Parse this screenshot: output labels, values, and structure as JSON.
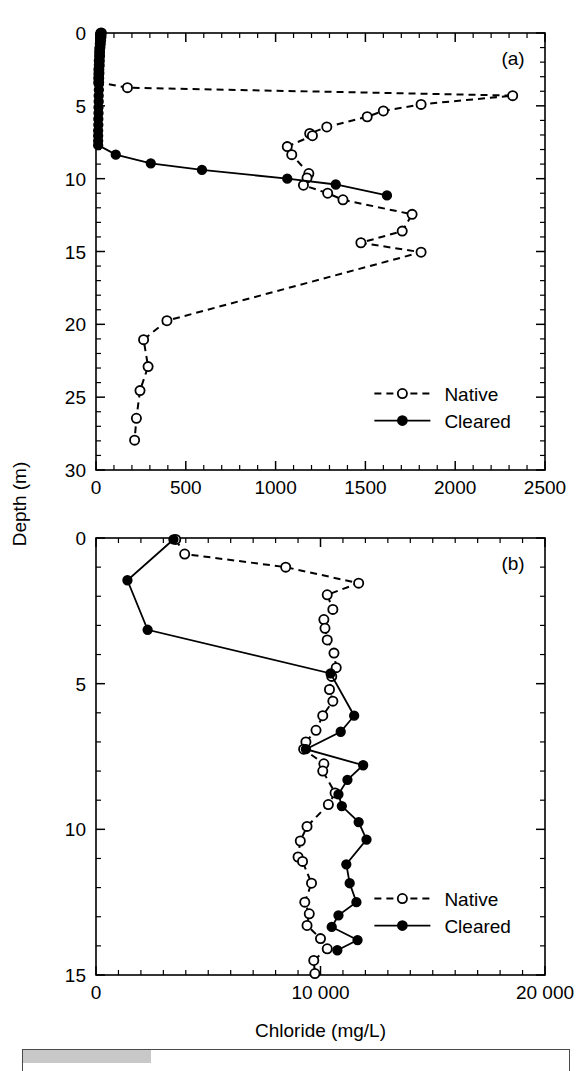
{
  "figure": {
    "y_axis_title": "Depth (m)",
    "x_axis_title": "Chloride (mg/L)"
  },
  "panel_a": {
    "label": "(a)",
    "legend": [
      {
        "label": "Native",
        "marker": "open-circle",
        "line": "dashed"
      },
      {
        "label": "Cleared",
        "marker": "filled-circle",
        "line": "solid"
      }
    ],
    "x_ticklabels": [
      "0",
      "500",
      "1000",
      "1500",
      "2000",
      "2500"
    ],
    "y_ticklabels": [
      "0",
      "5",
      "10",
      "15",
      "20",
      "25",
      "30"
    ]
  },
  "panel_b": {
    "label": "(b)",
    "legend": [
      {
        "label": "Native",
        "marker": "open-circle",
        "line": "dashed"
      },
      {
        "label": "Cleared",
        "marker": "filled-circle",
        "line": "solid"
      }
    ],
    "x_ticklabels": [
      "0",
      "10 000",
      "20 000"
    ],
    "y_ticklabels": [
      "0",
      "5",
      "10",
      "15"
    ]
  },
  "chart_data": [
    {
      "id": "panel-a",
      "type": "line",
      "title": "(a)",
      "xlabel": "Chloride (mg/L)",
      "ylabel": "Depth (m)",
      "xlim": [
        0,
        2500
      ],
      "ylim": [
        0,
        30
      ],
      "y_inverted": true,
      "x_major_tick": 500,
      "x_minor_tick": 100,
      "y_major_tick": 5,
      "y_minor_tick": 1,
      "grid": false,
      "legend_position": "lower-right",
      "x_unit": "mg/L",
      "y_unit": "m",
      "series": [
        {
          "name": "Native",
          "marker": "open-circle",
          "linestyle": "dashed",
          "points": [
            {
              "x": 30,
              "y": 0.0
            },
            {
              "x": 28,
              "y": 0.25
            },
            {
              "x": 26,
              "y": 0.5
            },
            {
              "x": 24,
              "y": 0.75
            },
            {
              "x": 22,
              "y": 1.0
            },
            {
              "x": 20,
              "y": 1.3
            },
            {
              "x": 20,
              "y": 1.6
            },
            {
              "x": 18,
              "y": 1.9
            },
            {
              "x": 18,
              "y": 2.2
            },
            {
              "x": 16,
              "y": 2.5
            },
            {
              "x": 16,
              "y": 2.8
            },
            {
              "x": 15,
              "y": 3.1
            },
            {
              "x": 15,
              "y": 3.4
            },
            {
              "x": 175,
              "y": 3.75
            },
            {
              "x": 2320,
              "y": 4.3
            },
            {
              "x": 1810,
              "y": 4.9
            },
            {
              "x": 1600,
              "y": 5.35
            },
            {
              "x": 1510,
              "y": 5.75
            },
            {
              "x": 1285,
              "y": 6.45
            },
            {
              "x": 1190,
              "y": 6.9
            },
            {
              "x": 1205,
              "y": 7.05
            },
            {
              "x": 1065,
              "y": 7.8
            },
            {
              "x": 1090,
              "y": 8.35
            },
            {
              "x": 1185,
              "y": 9.65
            },
            {
              "x": 1175,
              "y": 9.95
            },
            {
              "x": 1155,
              "y": 10.45
            },
            {
              "x": 1290,
              "y": 11.0
            },
            {
              "x": 1375,
              "y": 11.45
            },
            {
              "x": 1760,
              "y": 12.45
            },
            {
              "x": 1705,
              "y": 13.6
            },
            {
              "x": 1475,
              "y": 14.4
            },
            {
              "x": 1810,
              "y": 15.05
            },
            {
              "x": 395,
              "y": 19.75
            },
            {
              "x": 265,
              "y": 21.05
            },
            {
              "x": 290,
              "y": 22.9
            },
            {
              "x": 245,
              "y": 24.55
            },
            {
              "x": 225,
              "y": 26.45
            },
            {
              "x": 215,
              "y": 27.95
            }
          ]
        },
        {
          "name": "Cleared",
          "marker": "filled-circle",
          "linestyle": "solid",
          "points": [
            {
              "x": 25,
              "y": 0.0
            },
            {
              "x": 24,
              "y": 0.3
            },
            {
              "x": 22,
              "y": 0.7
            },
            {
              "x": 20,
              "y": 1.1
            },
            {
              "x": 20,
              "y": 1.5
            },
            {
              "x": 19,
              "y": 1.9
            },
            {
              "x": 18,
              "y": 2.3
            },
            {
              "x": 18,
              "y": 2.7
            },
            {
              "x": 17,
              "y": 3.1
            },
            {
              "x": 16,
              "y": 3.5
            },
            {
              "x": 16,
              "y": 3.9
            },
            {
              "x": 15,
              "y": 4.3
            },
            {
              "x": 15,
              "y": 4.7
            },
            {
              "x": 14,
              "y": 5.1
            },
            {
              "x": 14,
              "y": 5.5
            },
            {
              "x": 13,
              "y": 5.9
            },
            {
              "x": 13,
              "y": 6.3
            },
            {
              "x": 12,
              "y": 6.7
            },
            {
              "x": 12,
              "y": 7.05
            },
            {
              "x": 12,
              "y": 7.4
            },
            {
              "x": 12,
              "y": 7.7
            },
            {
              "x": 110,
              "y": 8.35
            },
            {
              "x": 305,
              "y": 8.95
            },
            {
              "x": 590,
              "y": 9.4
            },
            {
              "x": 1065,
              "y": 10.0
            },
            {
              "x": 1335,
              "y": 10.4
            },
            {
              "x": 1620,
              "y": 11.15
            }
          ]
        }
      ]
    },
    {
      "id": "panel-b",
      "type": "line",
      "title": "(b)",
      "xlabel": "Chloride (mg/L)",
      "ylabel": "Depth (m)",
      "xlim": [
        0,
        20000
      ],
      "ylim": [
        0,
        15
      ],
      "y_inverted": true,
      "x_major_tick": 10000,
      "x_minor_tick": 1000,
      "y_major_tick": 5,
      "y_minor_tick": 1,
      "grid": false,
      "legend_position": "lower-right",
      "x_unit": "mg/L",
      "y_unit": "m",
      "series": [
        {
          "name": "Native",
          "marker": "open-circle",
          "linestyle": "dashed",
          "points": [
            {
              "x": 3550,
              "y": 0.05
            },
            {
              "x": 3950,
              "y": 0.55
            },
            {
              "x": 8450,
              "y": 1.0
            },
            {
              "x": 11700,
              "y": 1.55
            },
            {
              "x": 10300,
              "y": 1.95
            },
            {
              "x": 10550,
              "y": 2.45
            },
            {
              "x": 10150,
              "y": 2.8
            },
            {
              "x": 10200,
              "y": 3.1
            },
            {
              "x": 10300,
              "y": 3.5
            },
            {
              "x": 10600,
              "y": 3.95
            },
            {
              "x": 10700,
              "y": 4.45
            },
            {
              "x": 10500,
              "y": 4.75
            },
            {
              "x": 10400,
              "y": 5.2
            },
            {
              "x": 10550,
              "y": 5.6
            },
            {
              "x": 10100,
              "y": 6.1
            },
            {
              "x": 9800,
              "y": 6.6
            },
            {
              "x": 9350,
              "y": 7.0
            },
            {
              "x": 9250,
              "y": 7.25
            },
            {
              "x": 10150,
              "y": 7.75
            },
            {
              "x": 10100,
              "y": 8.0
            },
            {
              "x": 10650,
              "y": 8.75
            },
            {
              "x": 10350,
              "y": 9.15
            },
            {
              "x": 9400,
              "y": 9.9
            },
            {
              "x": 9100,
              "y": 10.4
            },
            {
              "x": 9000,
              "y": 10.95
            },
            {
              "x": 9200,
              "y": 11.1
            },
            {
              "x": 9600,
              "y": 11.85
            },
            {
              "x": 9300,
              "y": 12.5
            },
            {
              "x": 9500,
              "y": 12.9
            },
            {
              "x": 9400,
              "y": 13.3
            },
            {
              "x": 10000,
              "y": 13.75
            },
            {
              "x": 10300,
              "y": 14.1
            },
            {
              "x": 9700,
              "y": 14.5
            },
            {
              "x": 9750,
              "y": 14.95
            }
          ]
        },
        {
          "name": "Cleared",
          "marker": "filled-circle",
          "linestyle": "solid",
          "points": [
            {
              "x": 3450,
              "y": 0.05
            },
            {
              "x": 1400,
              "y": 1.45
            },
            {
              "x": 2300,
              "y": 3.15
            },
            {
              "x": 10450,
              "y": 4.65
            },
            {
              "x": 11500,
              "y": 6.1
            },
            {
              "x": 10900,
              "y": 6.65
            },
            {
              "x": 9350,
              "y": 7.25
            },
            {
              "x": 11900,
              "y": 7.8
            },
            {
              "x": 11200,
              "y": 8.3
            },
            {
              "x": 10800,
              "y": 8.8
            },
            {
              "x": 10950,
              "y": 9.2
            },
            {
              "x": 11700,
              "y": 9.75
            },
            {
              "x": 12050,
              "y": 10.35
            },
            {
              "x": 11150,
              "y": 11.2
            },
            {
              "x": 11300,
              "y": 11.85
            },
            {
              "x": 11600,
              "y": 12.5
            },
            {
              "x": 10800,
              "y": 12.95
            },
            {
              "x": 10500,
              "y": 13.35
            },
            {
              "x": 11650,
              "y": 13.8
            },
            {
              "x": 10750,
              "y": 14.15
            }
          ]
        }
      ]
    }
  ]
}
